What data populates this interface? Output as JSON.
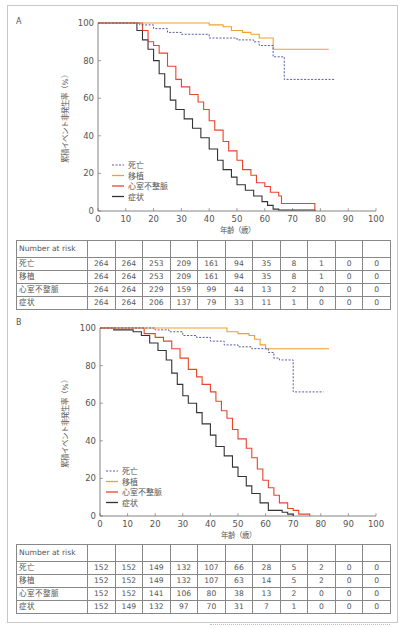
{
  "panels": [
    {
      "label": "A",
      "ylabel": "累積イベント非発生率（%）",
      "xlabel": "年齢（歳）",
      "yticks": [
        "0",
        "20",
        "40",
        "60",
        "80",
        "100"
      ],
      "xticks": [
        "0",
        "10",
        "20",
        "30",
        "40",
        "50",
        "60",
        "70",
        "80",
        "90",
        "100"
      ],
      "legend": [
        {
          "name": "死亡",
          "color": "#5a5aa8",
          "dash": "2,1.5"
        },
        {
          "name": "移植",
          "color": "#f0a030",
          "dash": ""
        },
        {
          "name": "心室不整脈",
          "color": "#e8442c",
          "dash": ""
        },
        {
          "name": "症状",
          "color": "#333333",
          "dash": ""
        }
      ],
      "table": {
        "header": "Number at risk",
        "rows": [
          {
            "label": "死亡",
            "values": [
              "264",
              "264",
              "253",
              "209",
              "161",
              "94",
              "35",
              "8",
              "1",
              "0",
              "0"
            ]
          },
          {
            "label": "移植",
            "values": [
              "264",
              "264",
              "253",
              "209",
              "161",
              "94",
              "35",
              "8",
              "1",
              "0",
              "0"
            ]
          },
          {
            "label": "心室不整脈",
            "values": [
              "264",
              "264",
              "229",
              "159",
              "99",
              "44",
              "13",
              "2",
              "0",
              "0",
              "0"
            ]
          },
          {
            "label": "症状",
            "values": [
              "264",
              "264",
              "206",
              "137",
              "79",
              "33",
              "11",
              "1",
              "0",
              "0",
              "0"
            ]
          }
        ]
      }
    },
    {
      "label": "B",
      "ylabel": "累積イベント非発生率（%）",
      "xlabel": "年齢（歳）",
      "yticks": [
        "0",
        "20",
        "40",
        "60",
        "80",
        "100"
      ],
      "xticks": [
        "0",
        "10",
        "20",
        "30",
        "40",
        "50",
        "60",
        "70",
        "80",
        "90",
        "100"
      ],
      "legend": [
        {
          "name": "死亡",
          "color": "#5a5aa8",
          "dash": "2,1.5"
        },
        {
          "name": "移植",
          "color": "#f0a030",
          "dash": ""
        },
        {
          "name": "心室不整脈",
          "color": "#e8442c",
          "dash": ""
        },
        {
          "name": "症状",
          "color": "#333333",
          "dash": ""
        }
      ],
      "table": {
        "header": "Number at risk",
        "rows": [
          {
            "label": "死亡",
            "values": [
              "152",
              "152",
              "149",
              "132",
              "107",
              "66",
              "28",
              "5",
              "2",
              "0",
              "0"
            ]
          },
          {
            "label": "移植",
            "values": [
              "152",
              "152",
              "149",
              "132",
              "107",
              "63",
              "14",
              "5",
              "2",
              "0",
              "0"
            ]
          },
          {
            "label": "心室不整脈",
            "values": [
              "152",
              "152",
              "141",
              "106",
              "80",
              "38",
              "13",
              "2",
              "0",
              "0",
              "0"
            ]
          },
          {
            "label": "症状",
            "values": [
              "152",
              "149",
              "132",
              "97",
              "70",
              "31",
              "7",
              "1",
              "0",
              "0",
              "0"
            ]
          }
        ]
      }
    }
  ],
  "chart_data": [
    {
      "type": "line",
      "title": "A",
      "xlabel": "年齢（歳）",
      "ylabel": "累積イベント非発生率（%）",
      "xlim": [
        0,
        100
      ],
      "ylim": [
        0,
        100
      ],
      "legend_position": "lower-left",
      "series": [
        {
          "name": "死亡",
          "points": [
            [
              0,
              100
            ],
            [
              12,
              100
            ],
            [
              15,
              99
            ],
            [
              20,
              97
            ],
            [
              25,
              95
            ],
            [
              30,
              94
            ],
            [
              40,
              92
            ],
            [
              50,
              91
            ],
            [
              56,
              90
            ],
            [
              58,
              88
            ],
            [
              63,
              88
            ],
            [
              63,
              82
            ],
            [
              67,
              82
            ],
            [
              67,
              70
            ],
            [
              85,
              70
            ]
          ]
        },
        {
          "name": "移植",
          "points": [
            [
              0,
              100
            ],
            [
              35,
              100
            ],
            [
              40,
              99
            ],
            [
              45,
              98
            ],
            [
              48,
              96
            ],
            [
              52,
              95
            ],
            [
              55,
              94
            ],
            [
              58,
              92
            ],
            [
              63,
              92
            ],
            [
              63,
              86
            ],
            [
              83,
              86
            ]
          ]
        },
        {
          "name": "心室不整脈",
          "points": [
            [
              0,
              100
            ],
            [
              14,
              100
            ],
            [
              16,
              96
            ],
            [
              18,
              90
            ],
            [
              20,
              88
            ],
            [
              22,
              84
            ],
            [
              25,
              77
            ],
            [
              28,
              70
            ],
            [
              30,
              66
            ],
            [
              33,
              62
            ],
            [
              36,
              58
            ],
            [
              38,
              54
            ],
            [
              40,
              48
            ],
            [
              42,
              43
            ],
            [
              45,
              37
            ],
            [
              47,
              32
            ],
            [
              50,
              27
            ],
            [
              52,
              22
            ],
            [
              55,
              19
            ],
            [
              57,
              15
            ],
            [
              60,
              13
            ],
            [
              62,
              10
            ],
            [
              65,
              8
            ],
            [
              66,
              4
            ],
            [
              78,
              4
            ],
            [
              78,
              0
            ]
          ]
        },
        {
          "name": "症状",
          "points": [
            [
              0,
              100
            ],
            [
              12,
              100
            ],
            [
              14,
              96
            ],
            [
              16,
              91
            ],
            [
              18,
              86
            ],
            [
              20,
              80
            ],
            [
              22,
              73
            ],
            [
              24,
              66
            ],
            [
              26,
              59
            ],
            [
              28,
              54
            ],
            [
              31,
              49
            ],
            [
              34,
              44
            ],
            [
              37,
              39
            ],
            [
              40,
              33
            ],
            [
              43,
              27
            ],
            [
              45,
              22
            ],
            [
              48,
              18
            ],
            [
              50,
              14
            ],
            [
              53,
              11
            ],
            [
              56,
              8
            ],
            [
              59,
              5
            ],
            [
              61,
              3
            ],
            [
              63,
              1
            ],
            [
              65,
              0.5
            ],
            [
              78,
              0.5
            ],
            [
              78,
              0
            ]
          ]
        }
      ]
    },
    {
      "type": "line",
      "title": "B",
      "xlabel": "年齢（歳）",
      "ylabel": "累積イベント非発生率（%）",
      "xlim": [
        0,
        100
      ],
      "ylim": [
        0,
        100
      ],
      "legend_position": "lower-left",
      "series": [
        {
          "name": "死亡",
          "points": [
            [
              0,
              100
            ],
            [
              15,
              100
            ],
            [
              20,
              99
            ],
            [
              25,
              98
            ],
            [
              30,
              96
            ],
            [
              35,
              95
            ],
            [
              40,
              93
            ],
            [
              45,
              91
            ],
            [
              50,
              90
            ],
            [
              55,
              89
            ],
            [
              60,
              89
            ],
            [
              61,
              87
            ],
            [
              63,
              84
            ],
            [
              65,
              83
            ],
            [
              69,
              83
            ],
            [
              70,
              66
            ],
            [
              81,
              66
            ]
          ]
        },
        {
          "name": "移植",
          "points": [
            [
              0,
              100
            ],
            [
              44,
              100
            ],
            [
              46,
              98
            ],
            [
              50,
              97
            ],
            [
              54,
              96
            ],
            [
              56,
              94
            ],
            [
              58,
              91
            ],
            [
              60,
              89
            ],
            [
              83,
              89
            ]
          ]
        },
        {
          "name": "心室不整脈",
          "points": [
            [
              0,
              100
            ],
            [
              12,
              100
            ],
            [
              16,
              97
            ],
            [
              20,
              95
            ],
            [
              23,
              93
            ],
            [
              26,
              89
            ],
            [
              29,
              84
            ],
            [
              32,
              78
            ],
            [
              35,
              74
            ],
            [
              37,
              70
            ],
            [
              40,
              66
            ],
            [
              42,
              61
            ],
            [
              44,
              56
            ],
            [
              46,
              52
            ],
            [
              48,
              46
            ],
            [
              50,
              41
            ],
            [
              53,
              36
            ],
            [
              55,
              31
            ],
            [
              57,
              25
            ],
            [
              59,
              19
            ],
            [
              61,
              15
            ],
            [
              63,
              11
            ],
            [
              65,
              7
            ],
            [
              68,
              4
            ],
            [
              70,
              3
            ],
            [
              72,
              1
            ],
            [
              76,
              1
            ],
            [
              76,
              0
            ]
          ]
        },
        {
          "name": "症状",
          "points": [
            [
              0,
              100
            ],
            [
              5,
              99
            ],
            [
              12,
              98
            ],
            [
              15,
              96
            ],
            [
              18,
              92
            ],
            [
              21,
              88
            ],
            [
              24,
              83
            ],
            [
              26,
              76
            ],
            [
              28,
              70
            ],
            [
              30,
              64
            ],
            [
              32,
              60
            ],
            [
              35,
              55
            ],
            [
              37,
              49
            ],
            [
              40,
              43
            ],
            [
              42,
              37
            ],
            [
              45,
              32
            ],
            [
              48,
              26
            ],
            [
              50,
              21
            ],
            [
              53,
              16
            ],
            [
              55,
              12
            ],
            [
              58,
              7
            ],
            [
              61,
              3
            ],
            [
              66,
              2
            ],
            [
              68,
              1
            ],
            [
              70,
              0
            ]
          ]
        }
      ]
    }
  ]
}
